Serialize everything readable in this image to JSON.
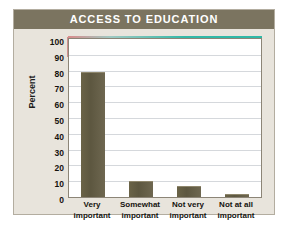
{
  "panel": {
    "title": "ACCESS TO EDUCATION",
    "background_color": "#e8e4dc",
    "title_band_color": "#7b7460",
    "title_text_color": "#ffffff",
    "border_color": "#b3ada0"
  },
  "chart_data": {
    "type": "bar",
    "title": "ACCESS TO EDUCATION",
    "categories": [
      "Very important",
      "Somewhat important",
      "Not very important",
      "Not at all important"
    ],
    "category_lines": [
      [
        "Very",
        "important"
      ],
      [
        "Somewhat",
        "important"
      ],
      [
        "Not very",
        "important"
      ],
      [
        "Not at all",
        "important"
      ]
    ],
    "values": [
      79,
      10,
      7,
      2
    ],
    "xlabel": "",
    "ylabel": "Percent",
    "ylim": [
      0,
      100
    ],
    "ytick_step": 10,
    "yticks": [
      100,
      90,
      80,
      70,
      60,
      50,
      40,
      30,
      20,
      10,
      0
    ],
    "grid": true,
    "grid_color": "#d5d8dc",
    "legend": "none",
    "bar_color": "#5d5740",
    "plot_background": "#ffffff",
    "plot_border_color": "#8c8577",
    "accent_line_color": "#2fb8a6"
  }
}
